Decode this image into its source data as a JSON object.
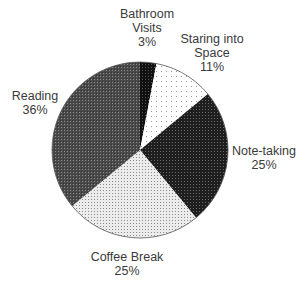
{
  "chart_data": {
    "type": "pie",
    "title": "",
    "start_angle_deg": -90,
    "direction": "clockwise",
    "center": [
      140,
      150
    ],
    "radius": 88,
    "slices": [
      {
        "label": "Bathroom Visits",
        "label_lines": [
          "Bathroom",
          "Visits",
          "3%"
        ],
        "value": 3,
        "pct_text": "3%",
        "pattern": "black",
        "label_pos": [
          147,
          18
        ]
      },
      {
        "label": "Staring into Space",
        "label_lines": [
          "Staring into",
          "Space",
          "11%"
        ],
        "value": 11,
        "pct_text": "11%",
        "pattern": "sparse-dots",
        "label_pos": [
          212,
          43
        ]
      },
      {
        "label": "Note-taking",
        "label_lines": [
          "Note-taking",
          "25%"
        ],
        "value": 25,
        "pct_text": "25%",
        "pattern": "dense-dark",
        "label_pos": [
          264,
          155
        ]
      },
      {
        "label": "Coffee Break",
        "label_lines": [
          "Coffee Break",
          "25%"
        ],
        "value": 25,
        "pct_text": "25%",
        "pattern": "light-dots",
        "label_pos": [
          127,
          261
        ]
      },
      {
        "label": "Reading",
        "label_lines": [
          "Reading",
          "36%"
        ],
        "value": 36,
        "pct_text": "36%",
        "pattern": "medium-dark",
        "label_pos": [
          35,
          100
        ]
      }
    ],
    "colors": {
      "black": "#1a1a1a",
      "sparse-dots": "#f4f4f4",
      "dense-dark": "#2a2a2a",
      "light-dots": "#d6d6d6",
      "medium-dark": "#5c5c5c",
      "outline": "#555555",
      "label": "#3a3a3a"
    }
  }
}
